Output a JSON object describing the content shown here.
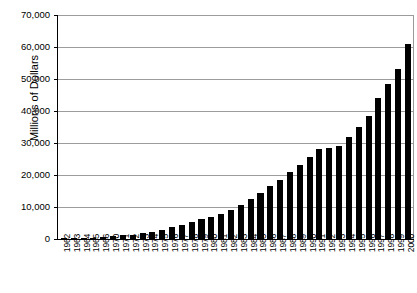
{
  "chart_data": {
    "type": "bar",
    "title": "",
    "subtitle": "",
    "xlabel": "",
    "ylabel": "Millions of Dollars",
    "ylim": [
      0,
      70000
    ],
    "ytick_step": 10000,
    "ytick_labels": [
      "70,000",
      "60,000",
      "50,000",
      "40,000",
      "30,000",
      "20,000",
      "10,000",
      "0"
    ],
    "ytick_values": [
      70000,
      60000,
      50000,
      40000,
      30000,
      20000,
      10000,
      0
    ],
    "grid": true,
    "legend": "none",
    "bar_color": "#000000",
    "categories": [
      "1962",
      "1963",
      "1964",
      "1965",
      "1966",
      "1970",
      "1971",
      "1972",
      "1973",
      "1974",
      "1975",
      "1976",
      "1977",
      "1978",
      "1979",
      "1980",
      "1981",
      "1982",
      "1983",
      "1984",
      "1985",
      "1986",
      "1987",
      "1988",
      "1989",
      "1990",
      "1991",
      "1992",
      "1993",
      "1994",
      "1995",
      "1996",
      "1997",
      "1998",
      "1999",
      "2000"
    ],
    "values": [
      300,
      350,
      400,
      450,
      500,
      900,
      1100,
      1400,
      1800,
      2300,
      2900,
      3600,
      4300,
      5200,
      6100,
      7000,
      7900,
      9000,
      10500,
      12500,
      14500,
      16500,
      18500,
      21000,
      23000,
      25500,
      28000,
      28500,
      29000,
      32000,
      35000,
      38500,
      44000,
      48500,
      53000,
      61000
    ]
  }
}
